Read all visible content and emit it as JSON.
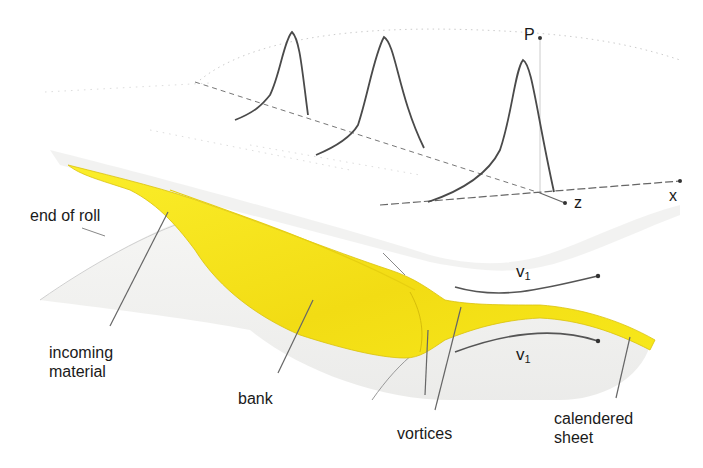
{
  "diagram": {
    "type": "calendering-process-schematic",
    "colors": {
      "material": "#f7e81a",
      "material_shade": "#e8cf10",
      "roll_surface": "#ececec",
      "line": "#444444",
      "dotted": "#bbbbbb"
    },
    "labels": {
      "end_of_roll": "end of roll",
      "incoming_material_line1": "incoming",
      "incoming_material_line2": "material",
      "bank": "bank",
      "vortices": "vortices",
      "calendered_sheet_line1": "calendered",
      "calendered_sheet_line2": "sheet"
    },
    "axes": {
      "p": "P",
      "z": "z",
      "x": "x"
    },
    "velocities": {
      "upper": {
        "symbol": "v",
        "subscript": "1"
      },
      "lower": {
        "symbol": "v",
        "subscript": "1"
      }
    },
    "pressure_profiles": [
      {
        "name": "profile-1",
        "position": "left"
      },
      {
        "name": "profile-2",
        "position": "middle"
      },
      {
        "name": "profile-3",
        "position": "right"
      }
    ]
  }
}
